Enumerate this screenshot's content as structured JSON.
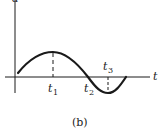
{
  "figure": {
    "caption": "(b)",
    "y_axis_label": "a",
    "x_axis_label": "t",
    "markers": [
      {
        "name": "t1",
        "base": "t",
        "sub": "1"
      },
      {
        "name": "t2",
        "base": "t",
        "sub": "2"
      },
      {
        "name": "t3",
        "base": "t",
        "sub": "3"
      }
    ],
    "colors": {
      "ink": "#1a1a1a",
      "background": "#ffffff"
    }
  }
}
